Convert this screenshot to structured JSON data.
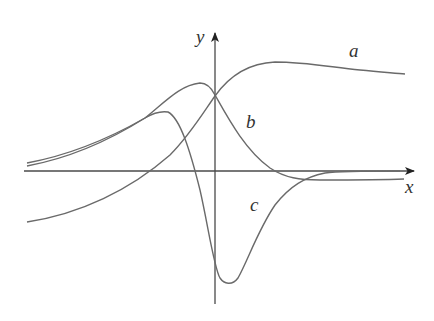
{
  "figure": {
    "axes": {
      "x_label": "x",
      "y_label": "y"
    },
    "curves": [
      {
        "id": "a",
        "label": "a",
        "shape": "rises from below x-axis on left, crosses y-axis above origin, peaks to the right, then slowly decreases toward a positive horizontal asymptote"
      },
      {
        "id": "b",
        "label": "b",
        "shape": "positive bump peaking just left of the y-axis, decreases through x-axis, dips slightly negative, then levels off just below x-axis"
      },
      {
        "id": "c",
        "label": "c",
        "shape": "positive peak left of y-axis, sharp drop crossing x-axis left of origin, deep minimum right of y-axis, then rises to approach x-axis"
      }
    ],
    "colors": {
      "curve": "#6a6a6a",
      "axis": "#4a4a4a",
      "label": "#333333",
      "background": "#ffffff"
    }
  }
}
